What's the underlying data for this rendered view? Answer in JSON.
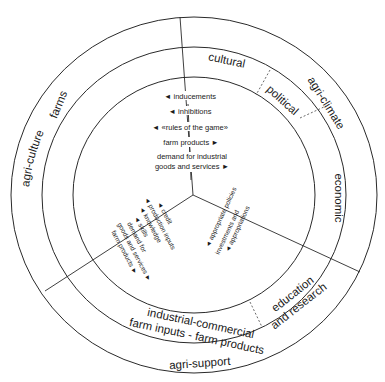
{
  "outer_ring": {
    "agri_culture": "agri-culture",
    "agri_climate": "agri-climate",
    "agri_support": "agri-support"
  },
  "middle_ring": {
    "farms": "farms",
    "cultural": "cultural",
    "political": "political",
    "economic": "economic",
    "education_research_1": "education",
    "education_research_2": "and research",
    "industrial_1": "industrial-commercial",
    "industrial_2": "farm inputs - farm products"
  },
  "center_top": {
    "items": [
      "◄ inducements",
      "◄ inhibitions",
      "◄ «rules of the game»",
      "farm products ►",
      "demand for industrial",
      "goods and services ►"
    ]
  },
  "center_left": {
    "items": [
      "◄ credit",
      "◄ production inputs",
      "◄ knowledge",
      "◄ skills",
      "demand for",
      "goods and services ►",
      "farm products ►"
    ]
  },
  "center_right": {
    "items": [
      "◄ appropriate policies",
      "investments and",
      "◄ appropriations"
    ]
  }
}
